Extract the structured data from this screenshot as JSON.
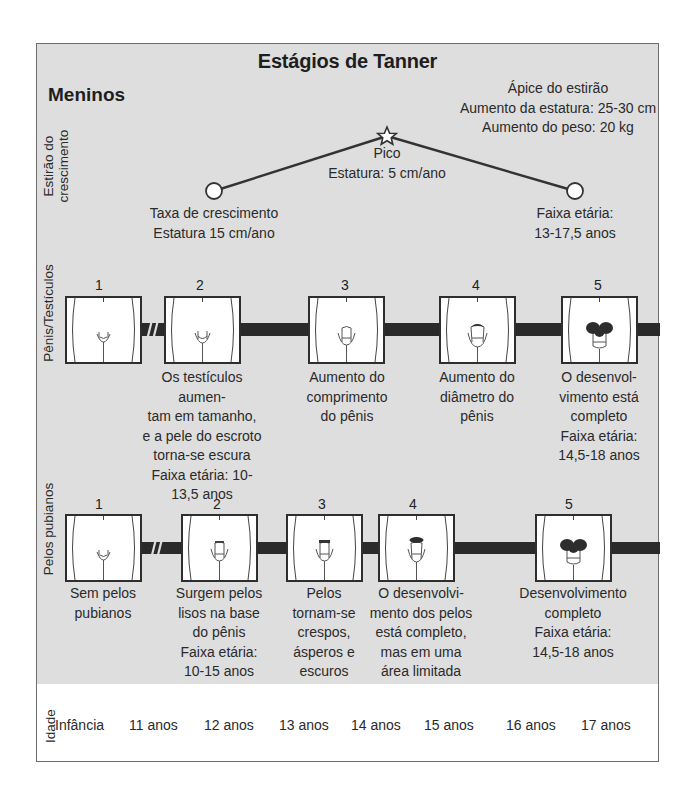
{
  "title": "Estágios de Tanner",
  "subtitle": "Meninos",
  "growth_spurt": {
    "row_label_line1": "Estirão do",
    "row_label_line2": "crescimento",
    "apex": {
      "line1": "Ápice do estirão",
      "line2": "Aumento da estatura: 25-30 cm",
      "line3": "Aumento do peso: 20 kg"
    },
    "peak": {
      "line1": "Pico",
      "line2": "Estatura: 5 cm/ano"
    },
    "start": {
      "line1": "Taxa de crescimento",
      "line2": "Estatura 15 cm/ano"
    },
    "end": {
      "line1": "Faixa etária:",
      "line2": "13-17,5 anos"
    },
    "icons": {
      "start": "circle-marker",
      "peak": "star-marker",
      "end": "circle-marker"
    }
  },
  "genitals": {
    "row_label": "Pênis/Testículos",
    "stages": [
      {
        "number": "1",
        "lines": []
      },
      {
        "number": "2",
        "lines": [
          "Os testículos aumen-",
          "tam em tamanho,",
          "e a pele do escroto",
          "torna-se escura",
          "Faixa etária: 10-",
          "13,5 anos"
        ]
      },
      {
        "number": "3",
        "lines": [
          "Aumento do",
          "comprimento",
          "do pênis"
        ]
      },
      {
        "number": "4",
        "lines": [
          "Aumento do",
          "diâmetro do",
          "pênis"
        ]
      },
      {
        "number": "5",
        "lines": [
          "O desenvol-",
          "vimento está",
          "completo",
          "Faixa etária:",
          "14,5-18 anos"
        ]
      }
    ]
  },
  "pubic_hair": {
    "row_label": "Pelos pubianos",
    "stages": [
      {
        "number": "1",
        "lines": [
          "Sem pelos",
          "pubianos"
        ]
      },
      {
        "number": "2",
        "lines": [
          "Surgem pelos",
          "lisos na base",
          "do pênis",
          "Faixa etária:",
          "10-15 anos"
        ]
      },
      {
        "number": "3",
        "lines": [
          "Pelos",
          "tornam-se",
          "crespos,",
          "ásperos e",
          "escuros"
        ]
      },
      {
        "number": "4",
        "lines": [
          "O desenvolvi-",
          "mento dos pelos",
          "está completo,",
          "mas em uma",
          "área limitada"
        ]
      },
      {
        "number": "5",
        "lines": [
          "Desenvolvimento",
          "completo",
          "Faixa etária:",
          "14,5-18 anos"
        ]
      }
    ]
  },
  "age": {
    "row_label": "Idade",
    "ticks": [
      "Infância",
      "11 anos",
      "12 anos",
      "13 anos",
      "14 anos",
      "15 anos",
      "16 anos",
      "17 anos"
    ]
  },
  "colors": {
    "panel_bg": "#dedede",
    "bar": "#2a2a2a",
    "border": "#6d6d6d",
    "text": "#1e1e1e"
  }
}
